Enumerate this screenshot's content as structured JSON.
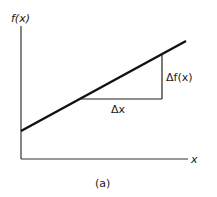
{
  "figure": {
    "caption": "(a)",
    "y_axis_label": "f(x)",
    "x_axis_label": "x",
    "delta_x_label": "Δx",
    "delta_fx_label": "Δf(x)",
    "colors": {
      "stroke": "#1a1a1a",
      "background": "#ffffff"
    }
  }
}
